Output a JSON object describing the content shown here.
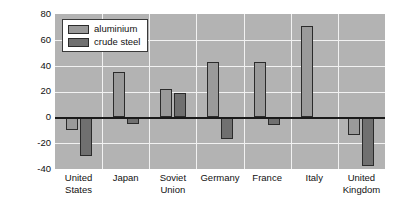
{
  "chart_data": {
    "type": "bar",
    "title": "",
    "xlabel": "",
    "ylabel": "percentage change (1973–88)",
    "ylim": [
      -40,
      80
    ],
    "ytick_values": [
      80,
      60,
      40,
      20,
      0,
      -20,
      -40
    ],
    "ytick_labels": [
      "80",
      "60",
      "40",
      "20",
      "0",
      "-20",
      "-40"
    ],
    "grid": true,
    "legend_position": "top-left",
    "categories": [
      "United\nStates",
      "Japan",
      "Soviet\nUnion",
      "Germany",
      "France",
      "Italy",
      "United\nKingdom"
    ],
    "series": [
      {
        "name": "aluminium",
        "color": "#9a9a9a",
        "values": [
          -10,
          35,
          22,
          43,
          43,
          71,
          -14
        ]
      },
      {
        "name": "crude steel",
        "color": "#707070",
        "values": [
          -30,
          -5,
          19,
          -17,
          -6,
          -1,
          -38
        ]
      }
    ]
  },
  "colors": {
    "plot_background": "#b3b3b3",
    "gridline": "#f2f2f2",
    "zero_line": "#1a1a1a",
    "bar_outline": "#2b2b2b",
    "text": "#111111",
    "page_background": "#ffffff"
  }
}
